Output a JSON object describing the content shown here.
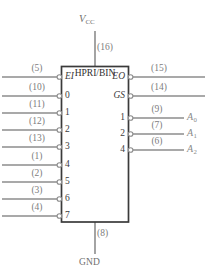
{
  "diagram": {
    "type": "logic-symbol",
    "device_title": "HPRI/BIN",
    "power": {
      "vcc_label": "V",
      "vcc_subscript": "CC",
      "vcc_pin": "(16)",
      "gnd_label": "GND",
      "gnd_pin": "(8)"
    },
    "left_pins": [
      {
        "pin": "(5)",
        "label": "EI",
        "italic": true
      },
      {
        "pin": "(10)",
        "label": "0",
        "italic": false
      },
      {
        "pin": "(11)",
        "label": "1",
        "italic": false
      },
      {
        "pin": "(12)",
        "label": "2",
        "italic": false
      },
      {
        "pin": "(13)",
        "label": "3",
        "italic": false
      },
      {
        "pin": "(1)",
        "label": "4",
        "italic": false
      },
      {
        "pin": "(2)",
        "label": "5",
        "italic": false
      },
      {
        "pin": "(3)",
        "label": "6",
        "italic": false
      },
      {
        "pin": "(4)",
        "label": "7",
        "italic": false
      }
    ],
    "right_pins": [
      {
        "pin": "(15)",
        "label": "EO",
        "italic": true,
        "signal": "",
        "sub": ""
      },
      {
        "pin": "(14)",
        "label": "GS",
        "italic": true,
        "signal": "",
        "sub": ""
      },
      {
        "pin": "(9)",
        "label": "1",
        "italic": false,
        "signal": "A",
        "sub": "0"
      },
      {
        "pin": "(7)",
        "label": "2",
        "italic": false,
        "signal": "A",
        "sub": "1"
      },
      {
        "pin": "(6)",
        "label": "4",
        "italic": false,
        "signal": "A",
        "sub": "2"
      }
    ],
    "colors": {
      "wire": "#8d8d8d",
      "box_outline": "#3a3a3a",
      "box_fill": "#ffffff",
      "pin_circle_stroke": "#8d8d8d",
      "text_gray": "#7b7b7b",
      "text_dark": "#333333"
    }
  }
}
